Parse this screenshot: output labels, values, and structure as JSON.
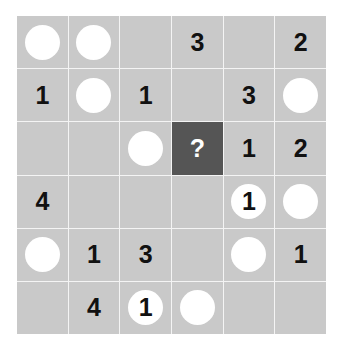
{
  "puzzle": {
    "rows": 6,
    "cols": 6,
    "colors": {
      "cell": "#c9c9c9",
      "highlight": "#555555",
      "circle": "#ffffff",
      "text": "#111111",
      "gridline": "#f4f4f4"
    },
    "cells": [
      [
        {
          "type": "circle",
          "value": ""
        },
        {
          "type": "circle",
          "value": ""
        },
        {
          "type": "empty",
          "value": ""
        },
        {
          "type": "number",
          "value": "3"
        },
        {
          "type": "empty",
          "value": ""
        },
        {
          "type": "number",
          "value": "2"
        }
      ],
      [
        {
          "type": "number",
          "value": "1"
        },
        {
          "type": "circle",
          "value": ""
        },
        {
          "type": "number",
          "value": "1"
        },
        {
          "type": "empty",
          "value": ""
        },
        {
          "type": "number",
          "value": "3"
        },
        {
          "type": "circle",
          "value": ""
        }
      ],
      [
        {
          "type": "empty",
          "value": ""
        },
        {
          "type": "empty",
          "value": ""
        },
        {
          "type": "circle",
          "value": ""
        },
        {
          "type": "question",
          "value": "?"
        },
        {
          "type": "number",
          "value": "1"
        },
        {
          "type": "number",
          "value": "2"
        }
      ],
      [
        {
          "type": "number",
          "value": "4"
        },
        {
          "type": "empty",
          "value": ""
        },
        {
          "type": "empty",
          "value": ""
        },
        {
          "type": "empty",
          "value": ""
        },
        {
          "type": "circle",
          "value": "1"
        },
        {
          "type": "circle",
          "value": ""
        }
      ],
      [
        {
          "type": "circle",
          "value": ""
        },
        {
          "type": "number",
          "value": "1"
        },
        {
          "type": "number",
          "value": "3"
        },
        {
          "type": "empty",
          "value": ""
        },
        {
          "type": "circle",
          "value": ""
        },
        {
          "type": "number",
          "value": "1"
        }
      ],
      [
        {
          "type": "empty",
          "value": ""
        },
        {
          "type": "number",
          "value": "4"
        },
        {
          "type": "circle",
          "value": "1"
        },
        {
          "type": "circle",
          "value": ""
        },
        {
          "type": "empty",
          "value": ""
        },
        {
          "type": "empty",
          "value": ""
        }
      ]
    ]
  }
}
